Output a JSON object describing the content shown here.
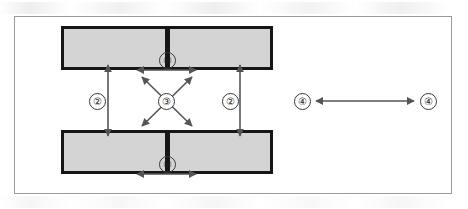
{
  "figure": {
    "background_color": "#ffffff",
    "frame_color": "#9a9a9a"
  },
  "colors": {
    "bar_fill": "#d4d4d4",
    "bar_outline": "#161616",
    "gap_fill": "#161616",
    "arrow": "#555555",
    "callout_text": "#1a1a1a"
  },
  "parts": {
    "bar_top_label": "upper-bar",
    "bar_bottom_label": "lower-bar",
    "gap_top_label": "upper-center-gap",
    "gap_bottom_label": "lower-center-gap"
  },
  "callouts": [
    {
      "id": "1-top",
      "label": "①",
      "number": "1",
      "measures": "gap width, upper bar"
    },
    {
      "id": "1-bottom",
      "label": "①",
      "number": "1",
      "measures": "gap width, lower bar"
    },
    {
      "id": "2-left",
      "label": "②",
      "number": "2",
      "measures": "vertical separation, left"
    },
    {
      "id": "2-right",
      "label": "②",
      "number": "2",
      "measures": "vertical separation, right"
    },
    {
      "id": "3-center",
      "label": "③",
      "number": "3",
      "measures": "diagonal cross spacing"
    },
    {
      "id": "4-left",
      "label": "④",
      "number": "4",
      "measures": "horizontal span, left end"
    },
    {
      "id": "4-right",
      "label": "④",
      "number": "4",
      "measures": "horizontal span, right end"
    }
  ],
  "arrows": [
    {
      "name": "gap-width-top",
      "type": "double-headed",
      "orientation": "horizontal"
    },
    {
      "name": "gap-width-bottom",
      "type": "double-headed",
      "orientation": "horizontal"
    },
    {
      "name": "separation-left",
      "type": "double-headed",
      "orientation": "vertical"
    },
    {
      "name": "separation-right",
      "type": "double-headed",
      "orientation": "vertical"
    },
    {
      "name": "diagonal-nw-se",
      "type": "double-headed",
      "orientation": "diagonal"
    },
    {
      "name": "diagonal-ne-sw",
      "type": "double-headed",
      "orientation": "diagonal"
    },
    {
      "name": "span-horizontal",
      "type": "double-headed",
      "orientation": "horizontal"
    }
  ]
}
